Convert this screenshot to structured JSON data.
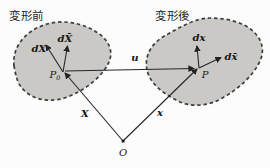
{
  "colors": {
    "blob_fill": "#cac9c6",
    "blob_stroke": "#3e3e3e",
    "line": "#262626"
  },
  "regions": {
    "before": {
      "label": "変形前"
    },
    "after": {
      "label": "変形後"
    }
  },
  "points": {
    "P0": {
      "main": "P",
      "sub": "0"
    },
    "P": {
      "label": "P"
    },
    "O": {
      "label": "O"
    }
  },
  "vectors": {
    "dX": "dX",
    "dX_bar": "dX̄",
    "dx": "dx",
    "dx_bar": "dx̄",
    "u": "u",
    "X": "X",
    "x": "x"
  }
}
